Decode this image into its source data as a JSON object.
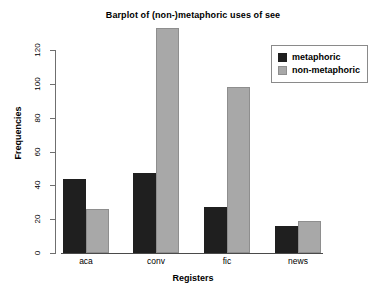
{
  "chart_data": {
    "type": "bar",
    "title": "Barplot of (non-)metaphoric uses of see",
    "xlabel": "Registers",
    "ylabel": "Frequencies",
    "categories": [
      "aca",
      "conv",
      "fic",
      "news"
    ],
    "series": [
      {
        "name": "metaphoric",
        "color": "#1f1f1f",
        "values": [
          44,
          47,
          27,
          16
        ]
      },
      {
        "name": "non-metaphoric",
        "color": "#a8a8a8",
        "values": [
          26,
          133,
          98,
          19
        ]
      }
    ],
    "ylim": [
      0,
      135
    ],
    "yticks": [
      0,
      20,
      40,
      60,
      80,
      100,
      120
    ],
    "ytick_labels": [
      "0",
      "20",
      "40",
      "60",
      "80",
      "100",
      "120"
    ],
    "grid": false,
    "legend_position": "top-right",
    "legend_entries": [
      "metaphoric",
      "non-metaphoric"
    ]
  }
}
